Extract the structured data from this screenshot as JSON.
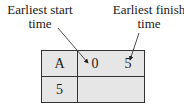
{
  "labels": {
    "earliest_start": [
      "Earliest start",
      "time"
    ],
    "earliest_finish": [
      "Earliest finish",
      "time"
    ]
  },
  "node": {
    "activity": "A",
    "earliest_start": "0",
    "earliest_finish": "5",
    "duration": "5"
  }
}
